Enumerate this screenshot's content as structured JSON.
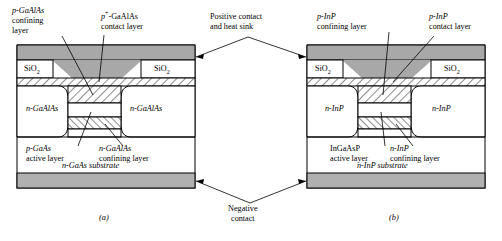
{
  "figure": {
    "caption_a": "(a)",
    "caption_b": "(b)",
    "center_top_label_line1": "Positive contact",
    "center_top_label_line2": "and heat sink",
    "center_bottom_label_line1": "Negative",
    "center_bottom_label_line2": "contact"
  },
  "colors": {
    "metal_fill": "#a8a8a8",
    "substrate_fill": "#b0b0b0",
    "sio2_fill": "#ffffff",
    "body_fill": "#ffffff",
    "outline": "#000000",
    "page_bg": "#ffffff"
  },
  "device_a": {
    "labels": {
      "confining_l1": "p-GaAlAs",
      "confining_l2": "confining",
      "confining_l3": "layer",
      "contact_l1": "p⁺-GaAlAs",
      "contact_l2": "contact layer",
      "active_l1": "p-GaAs",
      "active_l2": "active layer",
      "nconfining_l1": "n-GaAlAs",
      "nconfining_l2": "confining layer",
      "sio2_left": "SiO2",
      "sio2_right": "SiO2",
      "block_left": "n-GaAlAs",
      "block_right": "n-GaAlAs",
      "substrate": "n-GaAs substrate"
    }
  },
  "device_b": {
    "labels": {
      "confining_l1": "p-InP",
      "confining_l2": "confining layer",
      "contact_l1": "p-InP",
      "contact_l2": "contact layer",
      "active_l1": "InGaAsP",
      "active_l2": "active layer",
      "nconfining_l1": "n-InP",
      "nconfining_l2": "confining layer",
      "sio2_left": "SiO2",
      "sio2_right": "SiO2",
      "block_left": "n-InP",
      "block_right": "n-InP",
      "substrate": "n-InP substrate"
    }
  }
}
